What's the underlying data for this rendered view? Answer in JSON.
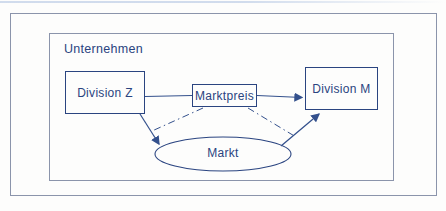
{
  "colors": {
    "navy": "#2a4480",
    "connector": "#33508c",
    "frame": "#8b94ab",
    "background": "#fdfdfc",
    "artifact": "#c9d6ea"
  },
  "diagram": {
    "frame_label": "Unternehmen",
    "nodes": {
      "division_z": {
        "label": "Division Z"
      },
      "marktpreis": {
        "label": "Marktpreis"
      },
      "division_m": {
        "label": "Division M"
      },
      "markt": {
        "label": "Markt"
      }
    }
  }
}
